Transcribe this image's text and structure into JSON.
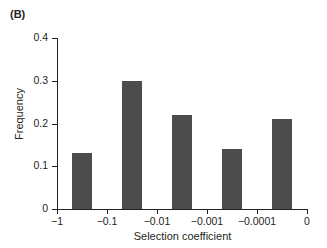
{
  "figure": {
    "panel_label": "(B)"
  },
  "chart_data": {
    "type": "bar",
    "title": "",
    "panel": "(B)",
    "xlabel": "Selection coefficient",
    "ylabel": "Frequency",
    "categories": [
      "-1 to -0.1",
      "-0.1 to -0.01",
      "-0.01 to -0.001",
      "-0.001 to -0.0001",
      "-0.0001 to 0"
    ],
    "values": [
      0.13,
      0.3,
      0.22,
      0.14,
      0.21
    ],
    "bar_color": "#4c4c4c",
    "ylim": [
      0,
      0.4
    ],
    "yticks": [
      0,
      0.1,
      0.2,
      0.3,
      0.4
    ],
    "ytick_labels": [
      "0",
      "0.1",
      "0.2",
      "0.3",
      "0.4"
    ],
    "xtick_labels": [
      "−1",
      "−0.1",
      "−0.01",
      "−0.001",
      "−0.0001",
      "0"
    ],
    "xscale": "log-like-categorical",
    "grid": false,
    "legend": null,
    "bars": [
      {
        "label": "-1 to -0.1",
        "value": 0.13
      },
      {
        "label": "-0.1 to -0.01",
        "value": 0.3
      },
      {
        "label": "-0.01 to -0.001",
        "value": 0.22
      },
      {
        "label": "-0.001 to -0.0001",
        "value": 0.14
      },
      {
        "label": "-0.0001 to 0",
        "value": 0.21
      }
    ]
  }
}
